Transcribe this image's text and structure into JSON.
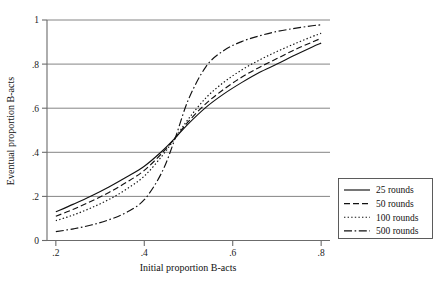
{
  "chart_data": {
    "type": "line",
    "title": "",
    "xlabel": "Initial proportion B-acts",
    "ylabel": "Eventual proportion B-acts",
    "xlim": [
      0.18,
      0.82
    ],
    "ylim": [
      0.0,
      1.0
    ],
    "grid": true,
    "grid_axis": "y",
    "legend_position": "right-bottom",
    "xticks": [
      0.2,
      0.4,
      0.6,
      0.8
    ],
    "xticklabels": [
      ".2",
      ".4",
      ".6",
      ".8"
    ],
    "yticks": [
      0,
      0.2,
      0.4,
      0.6,
      0.8,
      1
    ],
    "yticklabels": [
      "0",
      ".2",
      ".4",
      ".6",
      ".8",
      "1"
    ],
    "x": [
      0.2,
      0.24,
      0.28,
      0.32,
      0.36,
      0.4,
      0.44,
      0.47,
      0.5,
      0.54,
      0.58,
      0.62,
      0.66,
      0.7,
      0.74,
      0.78,
      0.8
    ],
    "series": [
      {
        "name": "25 rounds",
        "dash": "solid",
        "values": [
          0.13,
          0.165,
          0.202,
          0.243,
          0.288,
          0.337,
          0.405,
          0.465,
          0.53,
          0.605,
          0.665,
          0.716,
          0.762,
          0.8,
          0.84,
          0.878,
          0.895
        ]
      },
      {
        "name": "50 rounds",
        "dash": "dashed",
        "values": [
          0.11,
          0.142,
          0.178,
          0.218,
          0.264,
          0.318,
          0.396,
          0.465,
          0.54,
          0.622,
          0.686,
          0.74,
          0.785,
          0.825,
          0.865,
          0.9,
          0.917
        ]
      },
      {
        "name": "100 rounds",
        "dash": "dotted",
        "values": [
          0.09,
          0.116,
          0.148,
          0.186,
          0.233,
          0.292,
          0.383,
          0.465,
          0.552,
          0.648,
          0.718,
          0.773,
          0.818,
          0.857,
          0.892,
          0.925,
          0.94
        ]
      },
      {
        "name": "500 rounds",
        "dash": "dashdot",
        "values": [
          0.04,
          0.053,
          0.07,
          0.094,
          0.128,
          0.185,
          0.31,
          0.465,
          0.64,
          0.79,
          0.862,
          0.902,
          0.928,
          0.948,
          0.962,
          0.974,
          0.978
        ]
      }
    ]
  },
  "legend": {
    "items": [
      {
        "label": "25 rounds"
      },
      {
        "label": "50 rounds"
      },
      {
        "label": "100 rounds"
      },
      {
        "label": "500 rounds"
      }
    ]
  }
}
